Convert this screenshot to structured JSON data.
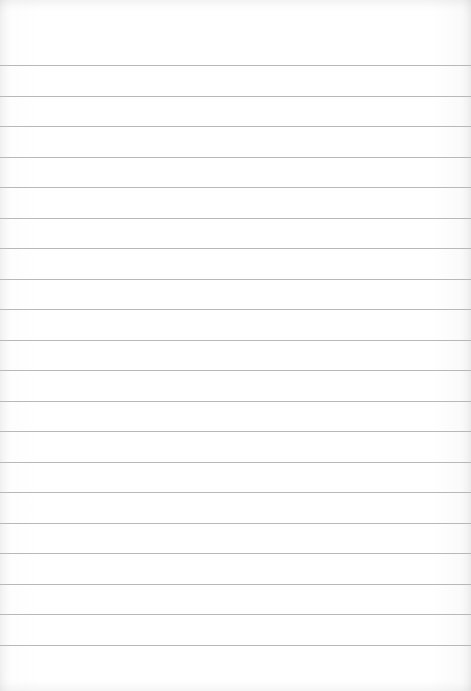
{
  "paper": {
    "type": "blank ruled notebook paper",
    "background_color": "#ffffff",
    "rule_color": "#b8b8b8",
    "first_rule_y": 65,
    "rule_spacing": 30.5,
    "rule_count": 20
  }
}
